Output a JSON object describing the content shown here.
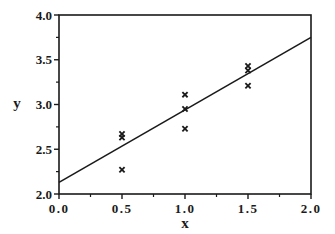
{
  "chart_data": {
    "type": "scatter",
    "title": "",
    "xlabel": "x",
    "ylabel": "y",
    "xlim": [
      0.0,
      2.0
    ],
    "ylim": [
      2.0,
      4.0
    ],
    "grid": false,
    "legend": null,
    "x_ticks": [
      "0.0",
      "0.5",
      "1.0",
      "1.5",
      "2.0"
    ],
    "y_ticks": [
      "2.0",
      "2.5",
      "3.0",
      "3.5",
      "4.0"
    ],
    "x_tick_values": [
      0.0,
      0.5,
      1.0,
      1.5,
      2.0
    ],
    "y_tick_values": [
      2.0,
      2.5,
      3.0,
      3.5,
      4.0
    ],
    "x_minor_tick_values": [
      0.25,
      0.75,
      1.25,
      1.75
    ],
    "y_minor_tick_values": [
      2.25,
      2.75,
      3.25,
      3.75
    ],
    "series": [
      {
        "name": "observations",
        "marker": "x",
        "points": [
          {
            "x": 0.5,
            "y": 2.67
          },
          {
            "x": 0.5,
            "y": 2.63
          },
          {
            "x": 0.5,
            "y": 2.27
          },
          {
            "x": 1.0,
            "y": 3.11
          },
          {
            "x": 1.0,
            "y": 2.95
          },
          {
            "x": 1.0,
            "y": 2.73
          },
          {
            "x": 1.5,
            "y": 3.43
          },
          {
            "x": 1.5,
            "y": 3.38
          },
          {
            "x": 1.5,
            "y": 3.21
          }
        ]
      },
      {
        "name": "fitted line",
        "type": "line",
        "points": [
          {
            "x": 0.0,
            "y": 2.13
          },
          {
            "x": 2.0,
            "y": 3.75
          }
        ]
      }
    ],
    "colors": {
      "ink": "#1a1a1a",
      "background": "#ffffff"
    }
  }
}
